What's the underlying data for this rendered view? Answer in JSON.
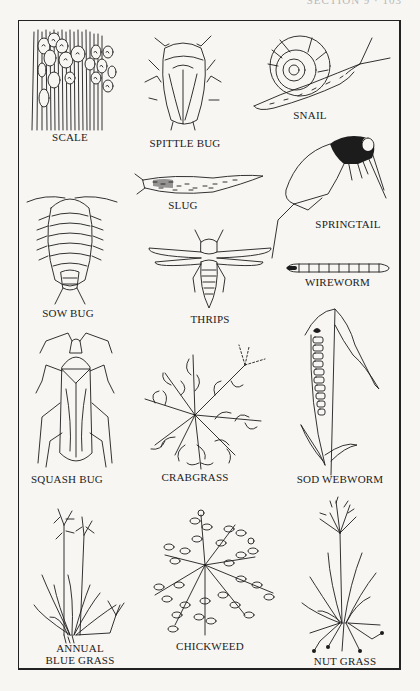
{
  "page": {
    "header_text": "SECTION 9 · 103",
    "figure_title": "Lawn pests and weeds"
  },
  "specimens": [
    {
      "id": "scale",
      "label": "SCALE",
      "kind": "insect"
    },
    {
      "id": "spittle-bug",
      "label": "SPITTLE BUG",
      "kind": "insect"
    },
    {
      "id": "snail",
      "label": "SNAIL",
      "kind": "mollusk"
    },
    {
      "id": "sow-bug",
      "label": "SOW BUG",
      "kind": "crustacean"
    },
    {
      "id": "slug",
      "label": "SLUG",
      "kind": "mollusk"
    },
    {
      "id": "springtail",
      "label": "SPRINGTAIL",
      "kind": "insect"
    },
    {
      "id": "thrips",
      "label": "THRIPS",
      "kind": "insect"
    },
    {
      "id": "wireworm",
      "label": "WIREWORM",
      "kind": "insect"
    },
    {
      "id": "squash-bug",
      "label": "SQUASH BUG",
      "kind": "insect"
    },
    {
      "id": "crabgrass",
      "label": "CRABGRASS",
      "kind": "weed"
    },
    {
      "id": "sod-webworm",
      "label": "SOD WEBWORM",
      "kind": "insect"
    },
    {
      "id": "annual-blue-grass",
      "label_line1": "ANNUAL",
      "label_line2": "BLUE GRASS",
      "kind": "weed"
    },
    {
      "id": "chickweed",
      "label": "CHICKWEED",
      "kind": "weed"
    },
    {
      "id": "nut-grass",
      "label": "NUT GRASS",
      "kind": "weed"
    }
  ],
  "colors": {
    "paper": "#f7f6f3",
    "ink": "#1c1c1c"
  }
}
